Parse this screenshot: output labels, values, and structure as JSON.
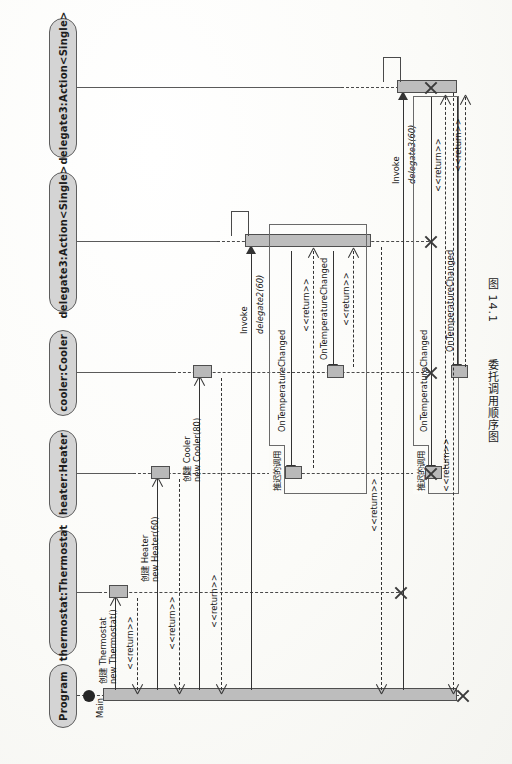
{
  "figure": {
    "caption_number": "图 14.1",
    "caption_title": "委托调用顺序图",
    "diagram_type": "UML Sequence Diagram",
    "page_orientation": "rotated-90-ccw"
  },
  "lifelines": [
    {
      "id": "program",
      "label": "Program"
    },
    {
      "id": "thermostat",
      "label": "thermostat:Thermostat"
    },
    {
      "id": "heater",
      "label": "heater:Heater"
    },
    {
      "id": "cooler",
      "label": "cooler:Cooler"
    },
    {
      "id": "delegate2",
      "label": "delegate3:Action<Single>"
    },
    {
      "id": "delegate3",
      "label": "delegate3:Action<Single>"
    }
  ],
  "start_label": "Main",
  "messages": [
    {
      "id": "m1",
      "label_cn": "创建 Thermostat",
      "label_code": "new Thermostat()",
      "from": "program",
      "to": "thermostat",
      "kind": "create"
    },
    {
      "id": "m2",
      "label": "<<return>>",
      "from": "thermostat",
      "to": "program",
      "kind": "return"
    },
    {
      "id": "m3",
      "label_cn": "创建 Heater",
      "label_code": "new Heater(60)",
      "from": "program",
      "to": "heater",
      "kind": "create"
    },
    {
      "id": "m4",
      "label": "<<return>>",
      "from": "heater",
      "to": "program",
      "kind": "return"
    },
    {
      "id": "m5",
      "label_cn": "创建 Cooler",
      "label_code": "new Cooler(80)",
      "from": "program",
      "to": "cooler",
      "kind": "create"
    },
    {
      "id": "m6",
      "label": "<<return>>",
      "from": "cooler",
      "to": "program",
      "kind": "return"
    },
    {
      "id": "m7",
      "label_a": "Invoke",
      "label_b": "delegate2(60)",
      "from": "program",
      "to": "delegate2",
      "kind": "sync"
    },
    {
      "id": "m8",
      "label": "OnTemperatureChanged",
      "from": "delegate2",
      "to": "heater",
      "kind": "sync"
    },
    {
      "id": "m9",
      "label": "<<return>>",
      "from": "heater",
      "to": "delegate2",
      "kind": "return"
    },
    {
      "id": "m10",
      "label": "OnTemperatureChanged",
      "from": "delegate2",
      "to": "cooler",
      "kind": "sync"
    },
    {
      "id": "m11",
      "label": "<<return>>",
      "from": "cooler",
      "to": "delegate2",
      "kind": "return"
    },
    {
      "id": "m12",
      "label": "<<return>>",
      "from": "delegate2",
      "to": "program",
      "kind": "return"
    },
    {
      "id": "m13",
      "label_a": "Invoke",
      "label_b": "delegate3(60)",
      "from": "program",
      "to": "delegate3",
      "kind": "sync"
    },
    {
      "id": "m14",
      "label": "OnTemperatureChanged",
      "from": "delegate3",
      "to": "heater",
      "kind": "sync"
    },
    {
      "id": "m15",
      "label": "<<return>>",
      "from": "heater",
      "to": "delegate3",
      "kind": "return"
    },
    {
      "id": "m16",
      "label": "OnTemperatureChanged",
      "from": "delegate3",
      "to": "cooler",
      "kind": "sync"
    },
    {
      "id": "m17",
      "label": "<<return>>",
      "from": "cooler",
      "to": "delegate3",
      "kind": "return"
    },
    {
      "id": "m18",
      "label": "<<return>>",
      "from": "delegate3",
      "to": "program",
      "kind": "return"
    }
  ],
  "fragments": [
    {
      "id": "frag1",
      "label": "推迟的调用"
    },
    {
      "id": "frag2",
      "label": "推迟的调用"
    }
  ],
  "colors": {
    "activation_fill": "#b9b9b9",
    "lifeline_head_fill": "#d4d4d4",
    "stroke": "#4a4a4a",
    "paper": "#fbfbf8"
  }
}
